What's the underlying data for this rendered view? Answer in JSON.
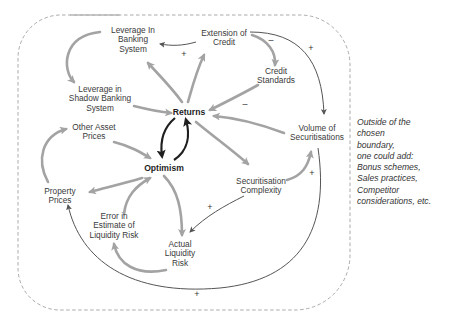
{
  "diagram": {
    "type": "causal-loop-diagram",
    "boundary": {
      "style": "dashed rounded rectangle",
      "color": "#9a9a9a"
    },
    "nodes": [
      {
        "id": "leverage_banking",
        "label_lines": [
          "Leverage In",
          "Banking",
          "System"
        ]
      },
      {
        "id": "extension_credit",
        "label_lines": [
          "Extension of",
          "Credit"
        ]
      },
      {
        "id": "credit_standards",
        "label_lines": [
          "Credit",
          "Standards"
        ]
      },
      {
        "id": "leverage_shadow",
        "label_lines": [
          "Leverage in",
          "Shadow Banking",
          "System"
        ]
      },
      {
        "id": "returns",
        "label_lines": [
          "Returns"
        ],
        "bold": true
      },
      {
        "id": "other_asset_prices",
        "label_lines": [
          "Other Asset",
          "Prices"
        ]
      },
      {
        "id": "optimism",
        "label_lines": [
          "Optimism"
        ],
        "bold": true
      },
      {
        "id": "volume_securitisations",
        "label_lines": [
          "Volume of",
          "Securitisations"
        ]
      },
      {
        "id": "securitisation_complexity",
        "label_lines": [
          "Securitisation",
          "Complexity"
        ]
      },
      {
        "id": "property_prices",
        "label_lines": [
          "Property",
          "Prices"
        ]
      },
      {
        "id": "error_liquidity",
        "label_lines": [
          "Error in",
          "Estimate of",
          "Liquidity Risk"
        ]
      },
      {
        "id": "actual_liquidity",
        "label_lines": [
          "Actual",
          "Liquidity",
          "Risk"
        ]
      }
    ],
    "edges": [
      {
        "from": "extension_credit",
        "to": "leverage_banking",
        "sign": "+"
      },
      {
        "from": "extension_credit",
        "to": "credit_standards",
        "sign": "-"
      },
      {
        "from": "extension_credit",
        "to": "volume_securitisations",
        "sign": "+"
      },
      {
        "from": "credit_standards",
        "to": "returns",
        "sign": "-"
      },
      {
        "from": "leverage_banking",
        "to": "leverage_shadow",
        "sign": ""
      },
      {
        "from": "leverage_shadow",
        "to": "returns",
        "sign": ""
      },
      {
        "from": "returns",
        "to": "leverage_banking",
        "sign": ""
      },
      {
        "from": "returns",
        "to": "extension_credit",
        "sign": ""
      },
      {
        "from": "returns",
        "to": "optimism",
        "sign": ""
      },
      {
        "from": "optimism",
        "to": "returns",
        "sign": ""
      },
      {
        "from": "returns",
        "to": "securitisation_complexity",
        "sign": ""
      },
      {
        "from": "volume_securitisations",
        "to": "returns",
        "sign": ""
      },
      {
        "from": "securitisation_complexity",
        "to": "volume_securitisations",
        "sign": "+"
      },
      {
        "from": "securitisation_complexity",
        "to": "actual_liquidity",
        "sign": "+"
      },
      {
        "from": "other_asset_prices",
        "to": "optimism",
        "sign": ""
      },
      {
        "from": "optimism",
        "to": "property_prices",
        "sign": ""
      },
      {
        "from": "property_prices",
        "to": "other_asset_prices",
        "sign": ""
      },
      {
        "from": "optimism",
        "to": "actual_liquidity",
        "sign": ""
      },
      {
        "from": "actual_liquidity",
        "to": "error_liquidity",
        "sign": ""
      },
      {
        "from": "error_liquidity",
        "to": "optimism",
        "sign": ""
      },
      {
        "from": "volume_securitisations",
        "to": "property_prices",
        "sign": "+"
      }
    ],
    "signs": {
      "plus": "+",
      "minus": "–"
    },
    "side_note_lines": [
      "Outside of the",
      "chosen",
      "boundary,",
      "one could add:",
      "Bonus schemes,",
      "Sales practices,",
      "Competitor",
      "considerations, etc."
    ],
    "colors": {
      "thick_arrow": "#a3a3a3",
      "thin_arrow": "#555555",
      "core_loop": "#1f1f1f",
      "boundary": "#a0a0a0"
    }
  }
}
